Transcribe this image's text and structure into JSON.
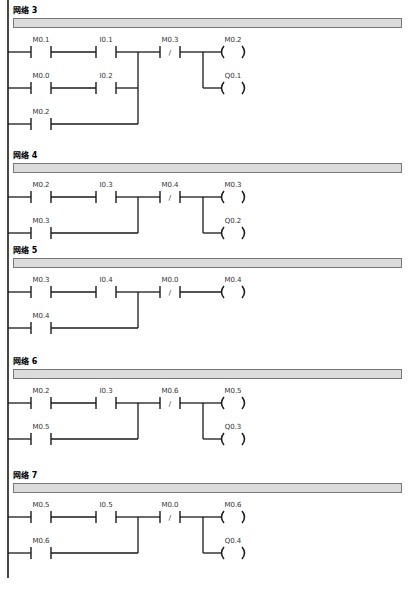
{
  "diagram_type": "PLC ladder diagram",
  "networks": [
    {
      "title": "网络 3",
      "rungs": [
        {
          "contacts": [
            {
              "addr": "M0.1",
              "type": "NO"
            },
            {
              "addr": "I0.1",
              "type": "NO"
            }
          ]
        },
        {
          "contacts": [
            {
              "addr": "M0.0",
              "type": "NO"
            },
            {
              "addr": "I0.2",
              "type": "NO"
            }
          ]
        },
        {
          "contacts": [
            {
              "addr": "M0.2",
              "type": "NO"
            }
          ]
        }
      ],
      "series_contact": {
        "addr": "M0.3",
        "type": "NC"
      },
      "coils": [
        "M0.2",
        "Q0.1"
      ]
    },
    {
      "title": "网络 4",
      "rungs": [
        {
          "contacts": [
            {
              "addr": "M0.2",
              "type": "NO"
            },
            {
              "addr": "I0.3",
              "type": "NO"
            }
          ]
        },
        {
          "contacts": [
            {
              "addr": "M0.3",
              "type": "NO"
            }
          ]
        }
      ],
      "series_contact": {
        "addr": "M0.4",
        "type": "NC"
      },
      "coils": [
        "M0.3",
        "Q0.2"
      ]
    },
    {
      "title": "网络 5",
      "rungs": [
        {
          "contacts": [
            {
              "addr": "M0.3",
              "type": "NO"
            },
            {
              "addr": "I0.4",
              "type": "NO"
            }
          ]
        },
        {
          "contacts": [
            {
              "addr": "M0.4",
              "type": "NO"
            }
          ]
        }
      ],
      "series_contact": {
        "addr": "M0.0",
        "type": "NC"
      },
      "coils": [
        "M0.4"
      ]
    },
    {
      "title": "网络 6",
      "rungs": [
        {
          "contacts": [
            {
              "addr": "M0.2",
              "type": "NO"
            },
            {
              "addr": "I0.3",
              "type": "NO"
            }
          ]
        },
        {
          "contacts": [
            {
              "addr": "M0.5",
              "type": "NO"
            }
          ]
        }
      ],
      "series_contact": {
        "addr": "M0.6",
        "type": "NC"
      },
      "coils": [
        "M0.5",
        "Q0.3"
      ]
    },
    {
      "title": "网络 7",
      "rungs": [
        {
          "contacts": [
            {
              "addr": "M0.5",
              "type": "NO"
            },
            {
              "addr": "I0.5",
              "type": "NO"
            }
          ]
        },
        {
          "contacts": [
            {
              "addr": "M0.6",
              "type": "NO"
            }
          ]
        }
      ],
      "series_contact": {
        "addr": "M0.0",
        "type": "NC"
      },
      "coils": [
        "M0.6",
        "Q0.4"
      ]
    }
  ],
  "layout": {
    "net_tops": [
      0,
      145,
      240,
      351,
      465
    ],
    "nc_symbol": "/"
  }
}
